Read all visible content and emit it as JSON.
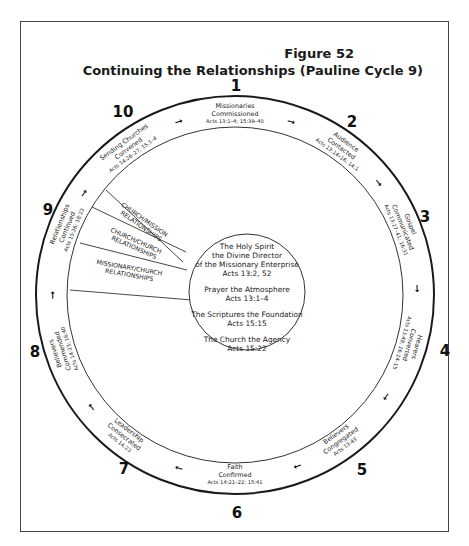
{
  "figure": {
    "label": "Figure 52",
    "title": "Continuing the Relationships (Pauline Cycle 9)"
  },
  "cycle_steps": [
    {
      "number": "1",
      "line1": "Missionaries",
      "line2": "Commissioned",
      "ref": "Acts 13:1–4; 15:39–40"
    },
    {
      "number": "2",
      "line1": "Audience",
      "line2": "Contacted",
      "ref": "Acts 13:14–16; 14:1"
    },
    {
      "number": "3",
      "line1": "Gospel",
      "line2": "Communicated",
      "ref": "Acts 13:17–41; 16:31"
    },
    {
      "number": "4",
      "line1": "Hearers",
      "line2": "Converted",
      "ref": "Acts 13:48; 16:14–15"
    },
    {
      "number": "5",
      "line1": "Believers",
      "line2": "Congregated",
      "ref": "Acts 13:43"
    },
    {
      "number": "6",
      "line1": "Faith",
      "line2": "Confirmed",
      "ref": "Acts 14:21–22; 15:41"
    },
    {
      "number": "7",
      "line1": "Leadership",
      "line2": "Consecrated",
      "ref": "Acts 14:23"
    },
    {
      "number": "8",
      "line1": "Believers",
      "line2": "Commended",
      "ref": "Acts 14:23; 16:40"
    },
    {
      "number": "9",
      "line1": "Relationships",
      "line2": "Continued",
      "ref": "Acts 15:36; 18:23"
    },
    {
      "number": "10",
      "line1": "Sending Churches",
      "line2": "Convened",
      "ref": "Acts 14:26–27; 15:1–4"
    }
  ],
  "relationships": [
    {
      "line1": "CHURCH/MISSION",
      "line2": "RELATIONSHIPS"
    },
    {
      "line1": "CHURCH/CHURCH",
      "line2": "RELATIONSHIPS"
    },
    {
      "line1": "MISSIONARY/CHURCH",
      "line2": "RELATIONSHIPS"
    }
  ],
  "center": {
    "spirit_l1": "The Holy Spirit",
    "spirit_l2": "the Divine Director",
    "spirit_l3": "of the Missionary Enterprise",
    "spirit_ref": "Acts 13:2, 52",
    "prayer": "Prayer the Atmosphere",
    "prayer_ref": "Acts 13:1–4",
    "scriptures": "The Scriptures the Foundation",
    "scriptures_ref": "Acts 15:15",
    "church": "The Church the Agency",
    "church_ref": "Acts 15:22"
  },
  "arrow_glyph": "➞",
  "colors": {
    "ink": "#1a1a1a",
    "paper": "#ffffff"
  }
}
